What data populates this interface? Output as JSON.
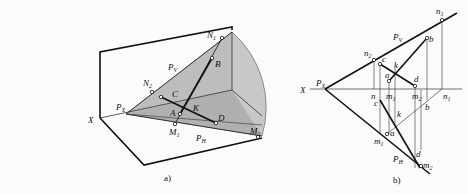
{
  "figure_a": {
    "caption": "a)",
    "labels": {
      "X": "X",
      "PX": "P",
      "PX_sub": "X",
      "PV": "P",
      "PV_sub": "V",
      "PH": "P",
      "PH_sub": "H",
      "N1": "N",
      "N1_sub": "1",
      "N2": "N",
      "N2_sub": "2",
      "M1": "M",
      "M1_sub": "1",
      "M2": "M",
      "M2_sub": "2",
      "A": "A",
      "B": "B",
      "C": "C",
      "D": "D",
      "K": "K"
    }
  },
  "figure_b": {
    "caption": "b)",
    "labels": {
      "X": "X",
      "PX": "P",
      "PX_sub": "X",
      "PV": "P",
      "PV_sub": "V",
      "PH": "P",
      "PH_sub": "H",
      "n1": "n",
      "n1_sub": "1",
      "n2": "n",
      "n2_sub": "2",
      "m1": "m",
      "m1_sub": "1",
      "m2": "m",
      "m2_sub": "2",
      "n": "n",
      "m1x": "m",
      "m1x_sub": "1",
      "m2x": "m",
      "m2x_sub": "2",
      "n1x": "n",
      "n1x_sub": "1",
      "a": "a",
      "b": "b",
      "c": "c",
      "d": "d",
      "k": "k",
      "a2": "a",
      "b2": "b",
      "c2": "c",
      "d2": "d",
      "k2": "k"
    }
  },
  "colors": {
    "plane_fill": "#c8c8c8",
    "line": "#111111"
  }
}
